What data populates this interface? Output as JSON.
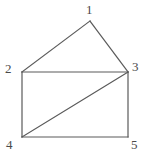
{
  "figure": {
    "type": "graph-diagram",
    "title": "",
    "width": 147,
    "height": 155,
    "background_color": "#ffffff",
    "edge_color": "#5a5a5a",
    "edge_width": 1.2,
    "label_color": "#4a4a4a",
    "label_font_size": 13
  },
  "chart_data": {
    "type": "diagram",
    "title": "",
    "nodes": [
      {
        "id": "1",
        "label": "1",
        "x": 90,
        "y": 21,
        "label_x": 86,
        "label_y": 3
      },
      {
        "id": "2",
        "label": "2",
        "x": 22,
        "y": 72,
        "label_x": 5,
        "label_y": 62
      },
      {
        "id": "3",
        "label": "3",
        "x": 128,
        "y": 72,
        "label_x": 132,
        "label_y": 60
      },
      {
        "id": "4",
        "label": "4",
        "x": 22,
        "y": 137,
        "label_x": 6,
        "label_y": 138
      },
      {
        "id": "5",
        "label": "5",
        "x": 128,
        "y": 137,
        "label_x": 131,
        "label_y": 138
      }
    ],
    "edges": [
      {
        "from": "2",
        "to": "1",
        "name": "edge-2-1"
      },
      {
        "from": "1",
        "to": "3",
        "name": "edge-1-3"
      },
      {
        "from": "2",
        "to": "3",
        "name": "edge-2-3"
      },
      {
        "from": "2",
        "to": "4",
        "name": "edge-2-4"
      },
      {
        "from": "3",
        "to": "5",
        "name": "edge-3-5"
      },
      {
        "from": "4",
        "to": "5",
        "name": "edge-4-5"
      },
      {
        "from": "4",
        "to": "3",
        "name": "edge-4-3"
      }
    ],
    "node_count": 5,
    "edge_count": 7
  }
}
